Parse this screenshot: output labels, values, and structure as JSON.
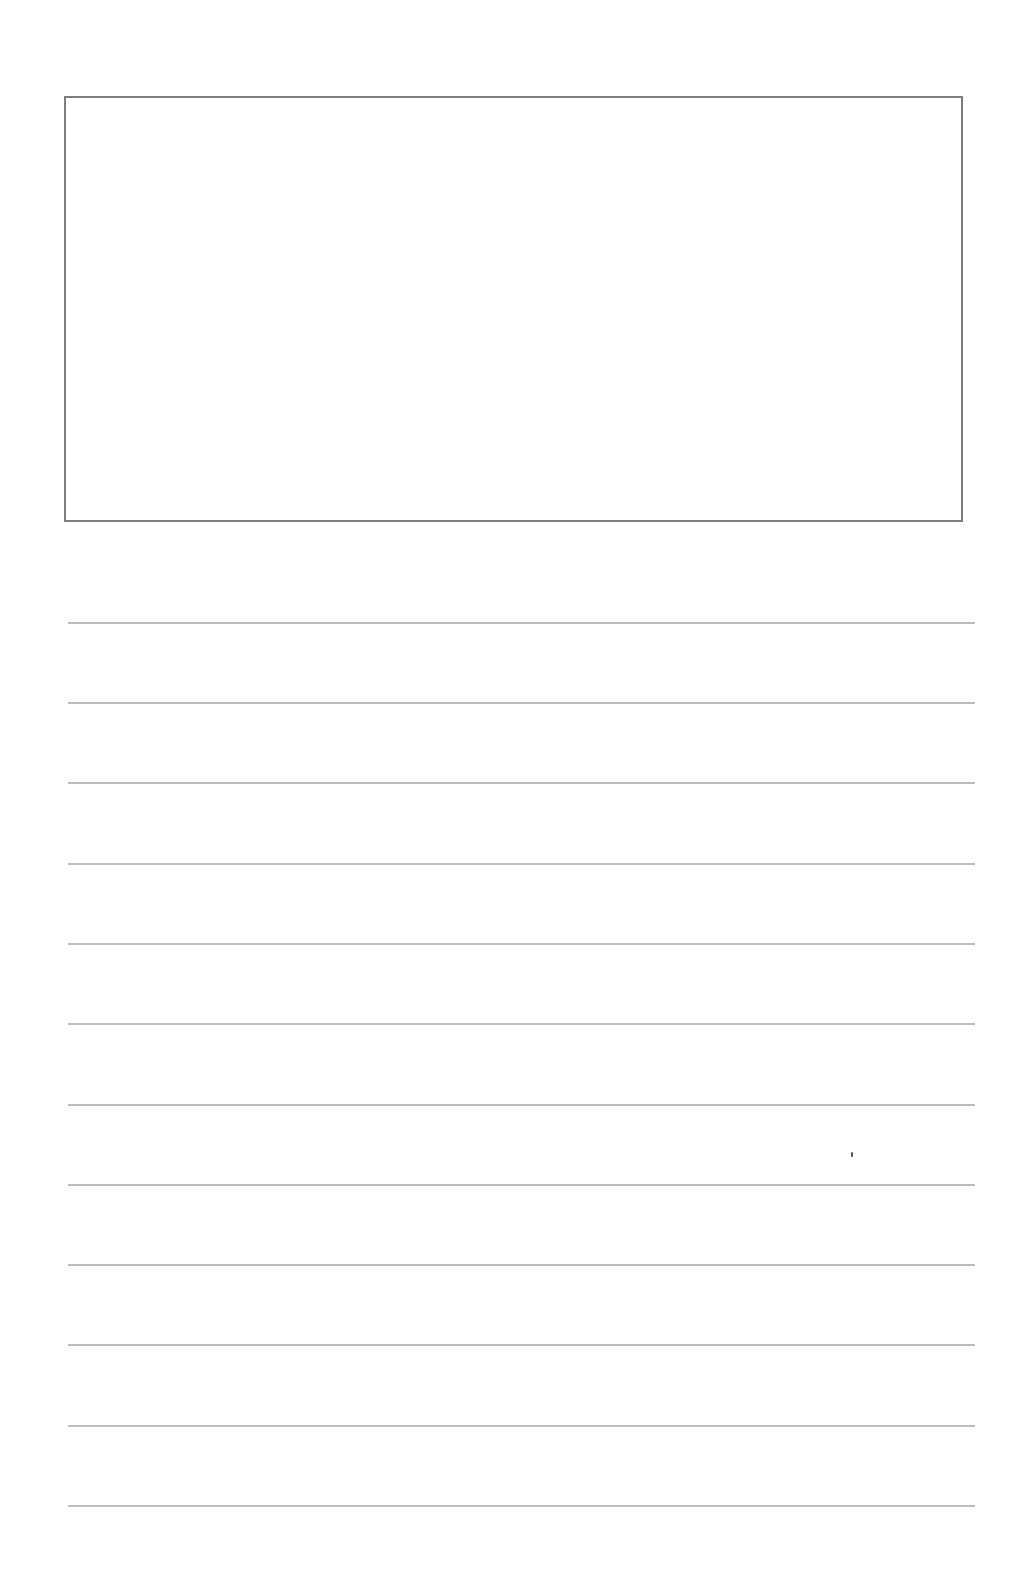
{
  "page": {
    "type": "writing-paper-template",
    "background": "#ffffff"
  },
  "drawing_box": {
    "border_color": "#7d7d7d",
    "content": ""
  },
  "ruled_lines": {
    "count": 12,
    "color": "#bdbdbd",
    "positions_y": [
      623,
      703,
      783,
      864,
      944,
      1024,
      1105,
      1185,
      1265,
      1345,
      1426,
      1506
    ]
  }
}
